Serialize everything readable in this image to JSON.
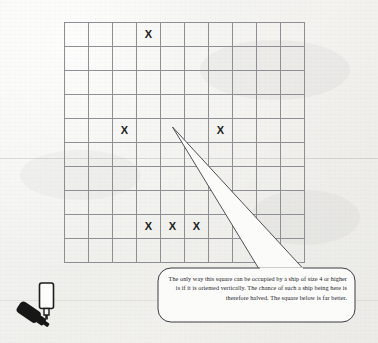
{
  "scene": {
    "title": "Battleship probability grid annotation",
    "background_color": "#f3f3f1",
    "ink_color": "#23232a",
    "grid_line_color": "#8e8e93"
  },
  "grid": {
    "name": "battleship-board",
    "columns": 10,
    "rows": 10,
    "cell_size_px": 24,
    "mark_glyph": "X",
    "marks": [
      {
        "row": 0,
        "col": 3,
        "label": "X"
      },
      {
        "row": 4,
        "col": 2,
        "label": "X"
      },
      {
        "row": 4,
        "col": 6,
        "label": "X"
      },
      {
        "row": 8,
        "col": 3,
        "label": "X"
      },
      {
        "row": 8,
        "col": 4,
        "label": "X"
      },
      {
        "row": 8,
        "col": 5,
        "label": "X"
      }
    ],
    "highlighted_intersection": {
      "row": 4,
      "col": 4
    }
  },
  "callout": {
    "name": "speech-bubble",
    "text": "The only way this square can be occupied by a ship of size 4 or higher is if it is oriented vertically. The chance of such a ship being here is therefore halved. The square below is far better.",
    "pointer_apex": {
      "x": 172,
      "y": 127
    },
    "outline_color": "#3c3c44",
    "fill_color": "#fbfbf9"
  },
  "pens": {
    "name": "marker-pens",
    "items": [
      {
        "name": "black-marker-pen",
        "style": "filled",
        "orientation": "diagonal"
      },
      {
        "name": "white-marker-pen",
        "style": "outline",
        "orientation": "upright"
      }
    ]
  }
}
